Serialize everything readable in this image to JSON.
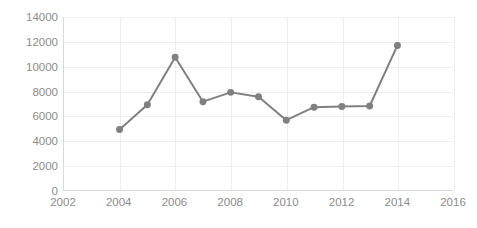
{
  "chart_data": {
    "type": "line",
    "title": "",
    "subtitle": "",
    "xlabel": "",
    "ylabel": "",
    "x": [
      2004,
      2005,
      2006,
      2007,
      2008,
      2009,
      2010,
      2011,
      2012,
      2013,
      2014
    ],
    "values": [
      4900,
      6900,
      10750,
      7150,
      7900,
      7550,
      5650,
      6700,
      6750,
      6800,
      11700
    ],
    "series": [
      {
        "name": "Series 1",
        "x": [
          2004,
          2005,
          2006,
          2007,
          2008,
          2009,
          2010,
          2011,
          2012,
          2013,
          2014
        ],
        "values": [
          4900,
          6900,
          10750,
          7150,
          7900,
          7550,
          5650,
          6700,
          6750,
          6800,
          11700
        ]
      }
    ],
    "xlim": [
      2002,
      2016
    ],
    "ylim": [
      0,
      14000
    ],
    "xticks": [
      2002,
      2004,
      2006,
      2008,
      2010,
      2012,
      2014,
      2016
    ],
    "xtick_labels": [
      "2002",
      "2004",
      "2006",
      "2008",
      "2010",
      "2012",
      "2014",
      "2016"
    ],
    "yticks": [
      0,
      2000,
      4000,
      6000,
      8000,
      10000,
      12000,
      14000
    ],
    "ytick_labels": [
      "0",
      "2000",
      "4000",
      "6000",
      "8000",
      "10000",
      "12000",
      "14000"
    ],
    "grid": {
      "horizontal": true,
      "vertical": true,
      "color": "#eceff1"
    },
    "legend": {
      "visible": false,
      "position": "none",
      "entries": []
    },
    "style": {
      "line_color": "#808080",
      "marker_color": "#808080",
      "marker_shape": "circle",
      "marker_size": 7,
      "line_width": 2,
      "axis_color": "#d9d9d9",
      "tick_label_color": "#8c8c8c",
      "background": "#ffffff"
    },
    "annotations": []
  }
}
